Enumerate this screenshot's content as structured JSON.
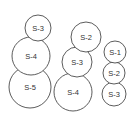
{
  "diagram": {
    "colors": {
      "stroke": "#4a4a4a",
      "fill": "#ffffff",
      "text": "#333333",
      "background": "#ffffff"
    },
    "stacks": [
      {
        "name": "stack-1",
        "circles": [
          {
            "label": "S-3",
            "cx": 38,
            "cy": 28,
            "r": 13
          },
          {
            "label": "S-4",
            "cx": 31,
            "cy": 56,
            "r": 19
          },
          {
            "label": "S-5",
            "cx": 30,
            "cy": 87,
            "r": 21
          }
        ]
      },
      {
        "name": "stack-2",
        "circles": [
          {
            "label": "S-2",
            "cx": 86,
            "cy": 37,
            "r": 15
          },
          {
            "label": "S-3",
            "cx": 77,
            "cy": 62,
            "r": 15
          },
          {
            "label": "S-4",
            "cx": 73,
            "cy": 92,
            "r": 19
          }
        ]
      },
      {
        "name": "stack-3",
        "circles": [
          {
            "label": "S-1",
            "cx": 115,
            "cy": 52,
            "r": 11
          },
          {
            "label": "S-2",
            "cx": 114,
            "cy": 73,
            "r": 11
          },
          {
            "label": "S-3",
            "cx": 114,
            "cy": 94,
            "r": 12
          }
        ]
      }
    ]
  }
}
